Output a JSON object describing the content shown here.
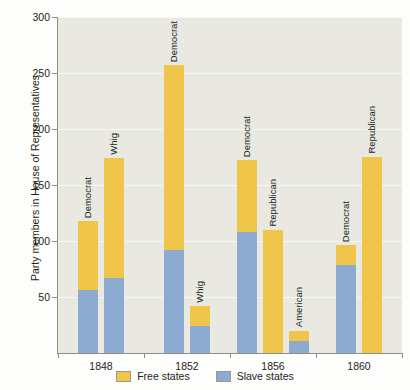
{
  "chart_data": {
    "type": "bar",
    "title": "",
    "subtitle": "",
    "xlabel": "",
    "ylabel": "Party members in House of Representatives",
    "ylim": [
      0,
      300
    ],
    "yticks": [
      50,
      100,
      150,
      200,
      250,
      300
    ],
    "ytick_labels": [
      "50",
      "100",
      "150",
      "200",
      "250",
      "300"
    ],
    "grid": true,
    "stacked": true,
    "legend_position": "bottom",
    "categories": [
      "1848",
      "1852",
      "1856",
      "1860"
    ],
    "series": [
      {
        "name": "Free states",
        "color": "#f0c64a"
      },
      {
        "name": "Slave states",
        "color": "#8dabd0"
      }
    ],
    "groups": [
      {
        "category": "1848",
        "bars": [
          {
            "label": "Democrat",
            "slave_states": 56,
            "free_states": 62,
            "total": 118
          },
          {
            "label": "Whig",
            "slave_states": 67,
            "free_states": 107,
            "total": 174
          }
        ]
      },
      {
        "category": "1852",
        "bars": [
          {
            "label": "Democrat",
            "slave_states": 92,
            "free_states": 165,
            "total": 257
          },
          {
            "label": "Whig",
            "slave_states": 24,
            "free_states": 18,
            "total": 42
          }
        ]
      },
      {
        "category": "1856",
        "bars": [
          {
            "label": "Democrat",
            "slave_states": 108,
            "free_states": 64,
            "total": 172
          },
          {
            "label": "Republican",
            "slave_states": 0,
            "free_states": 110,
            "total": 110
          },
          {
            "label": "American",
            "slave_states": 11,
            "free_states": 9,
            "total": 20
          }
        ]
      },
      {
        "category": "1860",
        "bars": [
          {
            "label": "Democrat",
            "slave_states": 79,
            "free_states": 17,
            "total": 96
          },
          {
            "label": "Republican",
            "slave_states": 0,
            "free_states": 175,
            "total": 175
          }
        ]
      }
    ]
  },
  "legend": {
    "items": [
      {
        "label": "Free states",
        "color": "#f0c64a",
        "swatch_name": "free-states-swatch"
      },
      {
        "label": "Slave states",
        "color": "#8dabd0",
        "swatch_name": "slave-states-swatch"
      }
    ]
  },
  "axes": {
    "y_label": "Party members in House of Representatives",
    "y_tick_labels": [
      "300",
      "250",
      "200",
      "150",
      "100",
      "50"
    ],
    "x_tick_labels": [
      "1848",
      "1852",
      "1856",
      "1860"
    ]
  }
}
